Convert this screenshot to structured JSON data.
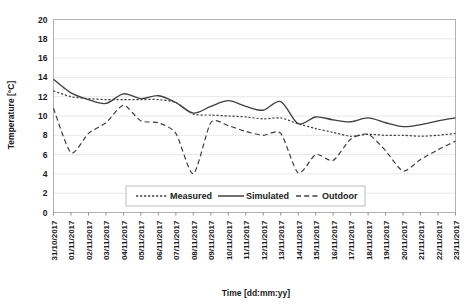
{
  "chart_data": {
    "type": "line",
    "title": "",
    "xlabel": "Time [dd:mm:yy]",
    "ylabel": "Temperature [°C]",
    "ylim": [
      0,
      20
    ],
    "ytick_step": 2,
    "yticks": [
      20,
      18,
      16,
      14,
      12,
      10,
      8,
      6,
      4,
      2,
      0
    ],
    "grid": "horizontal",
    "legend_position": "bottom-center",
    "categories": [
      "31/10/2017",
      "01/11/2017",
      "02/11/2017",
      "03/11/2017",
      "04/11/2017",
      "05/11/2017",
      "06/11/2017",
      "07/11/2017",
      "08/11/2017",
      "09/11/2017",
      "10/11/2017",
      "11/11/2017",
      "12/11/2017",
      "13/11/2017",
      "14/11/2017",
      "15/11/2017",
      "16/11/2017",
      "17/11/2017",
      "18/11/2017",
      "19/11/2017",
      "20/11/2017",
      "21/11/2017",
      "22/11/2017",
      "23/11/2017"
    ],
    "series": [
      {
        "name": "Measured",
        "style": "dotted",
        "color": "#3f3f3f",
        "values": [
          12.6,
          12.0,
          11.8,
          11.7,
          11.7,
          11.7,
          11.7,
          11.4,
          10.2,
          10.1,
          10.0,
          9.9,
          9.7,
          9.8,
          9.2,
          8.7,
          8.3,
          7.9,
          8.1,
          8.0,
          8.0,
          7.9,
          8.0,
          8.2
        ]
      },
      {
        "name": "Simulated",
        "style": "solid",
        "color": "#3f3f3f",
        "values": [
          13.8,
          12.4,
          11.7,
          11.3,
          12.3,
          11.8,
          12.1,
          11.4,
          10.3,
          11.0,
          11.6,
          11.0,
          10.6,
          11.5,
          9.2,
          9.9,
          9.6,
          9.4,
          9.8,
          9.3,
          8.9,
          9.1,
          9.5,
          9.8
        ]
      },
      {
        "name": "Outdoor",
        "style": "dashed",
        "color": "#3f3f3f",
        "values": [
          10.8,
          6.2,
          8.2,
          9.3,
          11.1,
          9.5,
          9.3,
          8.2,
          4.0,
          9.3,
          9.0,
          8.4,
          8.0,
          8.2,
          4.1,
          6.0,
          5.4,
          7.6,
          8.1,
          6.4,
          4.3,
          5.5,
          6.5,
          7.4
        ]
      }
    ]
  },
  "legend": {
    "items": [
      {
        "label": "Measured",
        "style": "dotted"
      },
      {
        "label": "Simulated",
        "style": "solid"
      },
      {
        "label": "Outdoor",
        "style": "dashed"
      }
    ]
  }
}
